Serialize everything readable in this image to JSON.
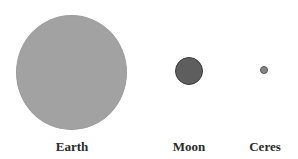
{
  "bodies": [
    {
      "name": "Earth",
      "color": "#a2a2a2",
      "border": "#9a9a9a"
    },
    {
      "name": "Moon",
      "color": "#5e5e5e",
      "border": "#3c3c3c"
    },
    {
      "name": "Ceres",
      "color": "#858585",
      "border": "#555555"
    }
  ]
}
